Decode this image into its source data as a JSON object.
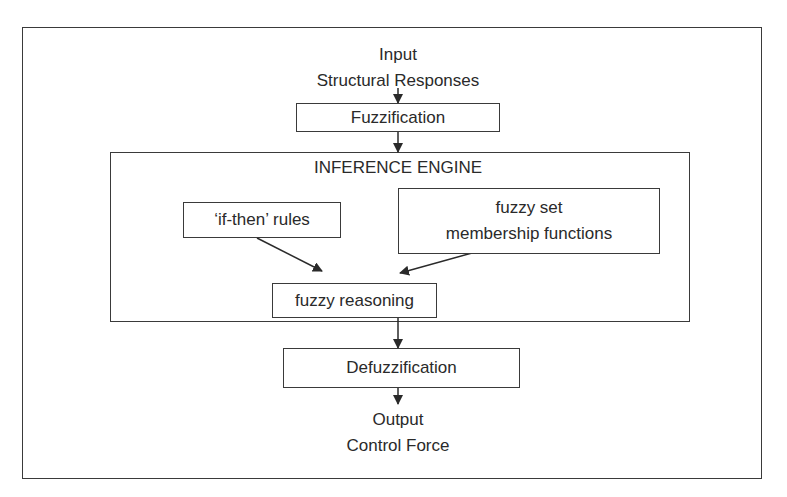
{
  "diagram": {
    "type": "flowchart",
    "input": {
      "line1": "Input",
      "line2": "Structural Responses"
    },
    "nodes": {
      "fuzzification": "Fuzzification",
      "inference_engine": "INFERENCE ENGINE",
      "if_then_rules": "‘if-then’ rules",
      "fuzzy_set_line1": "fuzzy set",
      "fuzzy_set_line2": "membership functions",
      "fuzzy_reasoning": "fuzzy reasoning",
      "defuzzification": "Defuzzification"
    },
    "output": {
      "line1": "Output",
      "line2": "Control Force"
    },
    "edges": [
      {
        "from": "Input Structural Responses",
        "to": "Fuzzification"
      },
      {
        "from": "Fuzzification",
        "to": "INFERENCE ENGINE"
      },
      {
        "from": "‘if-then’ rules",
        "to": "fuzzy reasoning"
      },
      {
        "from": "fuzzy set membership functions",
        "to": "fuzzy reasoning"
      },
      {
        "from": "fuzzy reasoning",
        "to": "Defuzzification"
      },
      {
        "from": "Defuzzification",
        "to": "Output Control Force"
      }
    ],
    "colors": {
      "stroke": "#3a3a3a",
      "text": "#2a2a2a",
      "background": "#ffffff"
    }
  }
}
